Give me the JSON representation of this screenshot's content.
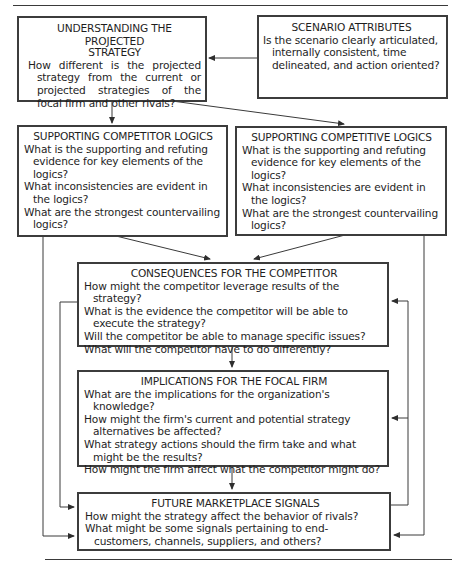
{
  "diagram": {
    "boxes": {
      "understanding": {
        "title_line1": "UNDERSTANDING THE PROJECTED",
        "title_line2": "STRATEGY",
        "questions": [
          "How different is the projected strategy from the current or projected strategies of the focal firm and other rivals?"
        ]
      },
      "scenario": {
        "title": "SCENARIO ATTRIBUTES",
        "questions": [
          "Is the scenario clearly articulated, internally consistent, time delineated, and action oriented?"
        ]
      },
      "competitor_logics": {
        "title": "SUPPORTING COMPETITOR LOGICS",
        "questions": [
          "What is the supporting and refuting evidence for key elements of the logics?",
          "What inconsistencies are evident in the logics?",
          "What are the strongest countervailing logics?"
        ]
      },
      "competitive_logics": {
        "title": "SUPPORTING COMPETITIVE LOGICS",
        "questions": [
          "What is the supporting and refuting evidence for key elements of the logics?",
          "What inconsistencies are evident in the logics?",
          "What are the strongest countervailing logics?"
        ]
      },
      "consequences": {
        "title": "CONSEQUENCES FOR THE COMPETITOR",
        "questions": [
          "How might the competitor leverage results of the strategy?",
          "What is the evidence the competitor will be able to execute the strategy?",
          "Will the competitor be able to manage specific issues?",
          "What will the competitor have to do differently?"
        ]
      },
      "implications": {
        "title": "IMPLICATIONS FOR THE FOCAL FIRM",
        "questions": [
          "What are the implications for the organization's knowledge?",
          "How might the firm's current and potential strategy alternatives be affected?",
          "What strategy actions should the firm take and what might be the results?",
          "How might the firm affect what the competitor might do?"
        ]
      },
      "signals": {
        "title": "FUTURE MARKETPLACE SIGNALS",
        "questions": [
          "How might the strategy affect the behavior of rivals?",
          "What might be some signals pertaining to end-customers, channels, suppliers, and others?"
        ]
      }
    },
    "edges": [
      {
        "from": "scenario",
        "to": "understanding"
      },
      {
        "from": "understanding",
        "to": "competitor_logics"
      },
      {
        "from": "understanding",
        "to": "competitive_logics"
      },
      {
        "from": "competitor_logics",
        "to": "consequences"
      },
      {
        "from": "competitive_logics",
        "to": "consequences"
      },
      {
        "from": "consequences",
        "to": "implications"
      },
      {
        "from": "implications",
        "to": "signals"
      },
      {
        "from": "competitor_logics",
        "to": "signals"
      },
      {
        "from": "consequences",
        "to": "signals"
      },
      {
        "from": "competitive_logics",
        "to": "signals"
      },
      {
        "from": "signals",
        "to": "consequences"
      },
      {
        "from": "signals",
        "to": "implications"
      }
    ],
    "colors": {
      "border": "#3c3c3c",
      "line": "#3a3a3a",
      "text": "#1e1e1e",
      "background": "#ffffff"
    }
  }
}
